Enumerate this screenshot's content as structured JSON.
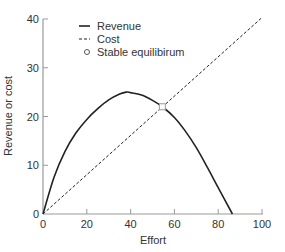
{
  "chart_data": {
    "type": "line",
    "title": "",
    "xlabel": "Effort",
    "ylabel": "Revenue or cost",
    "xlim": [
      0,
      100
    ],
    "ylim": [
      0,
      40
    ],
    "xticks": [
      0,
      20,
      40,
      60,
      80,
      100
    ],
    "yticks": [
      0,
      10,
      20,
      30,
      40
    ],
    "grid": false,
    "legend_position": "upper-left",
    "series": [
      {
        "name": "Revenue",
        "style": "solid",
        "x": [
          0,
          5,
          10,
          15,
          20,
          25,
          30,
          35,
          38,
          40,
          45,
          50,
          54.5,
          60,
          65,
          70,
          75,
          80,
          86.5
        ],
        "y": [
          0,
          7.5,
          12.8,
          16.6,
          19.4,
          21.6,
          23.4,
          24.6,
          25.0,
          24.9,
          24.4,
          23.3,
          22.0,
          19.8,
          17.0,
          13.6,
          9.6,
          5.4,
          0
        ]
      },
      {
        "name": "Cost",
        "style": "dashed",
        "x": [
          0,
          100
        ],
        "y": [
          0,
          40.3
        ]
      }
    ],
    "annotations": [
      {
        "name": "Stable equilibirum",
        "marker": "open-circle",
        "x": 54.5,
        "y": 22.0
      }
    ]
  },
  "legend": {
    "items": [
      {
        "label": "Revenue",
        "style": "solid"
      },
      {
        "label": "Cost",
        "style": "dashed"
      },
      {
        "label": "Stable equilibirum",
        "style": "open-circle"
      }
    ]
  },
  "colors": {
    "line": "#222222",
    "axis": "#999999",
    "text": "#333333"
  }
}
